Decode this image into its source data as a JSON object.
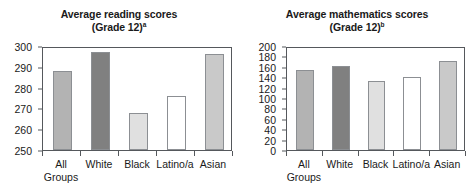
{
  "figure": {
    "panels": [
      {
        "id": "reading",
        "title_line1": "Average reading scores",
        "title_line2": "(Grade 12)",
        "title_superscript": "a"
      },
      {
        "id": "mathematics",
        "title_line1": "Average mathematics scores",
        "title_line2": "(Grade 12)",
        "title_superscript": "b"
      }
    ]
  },
  "chart_data": [
    {
      "type": "bar",
      "title": "Average reading scores (Grade 12)a",
      "xlabel": "",
      "ylabel": "",
      "categories": [
        "All Groups",
        "White",
        "Black",
        "Latino/a",
        "Asian"
      ],
      "category_lines": [
        [
          "All",
          "Groups"
        ],
        [
          "White"
        ],
        [
          "Black"
        ],
        [
          "Latino/a"
        ],
        [
          "Asian"
        ]
      ],
      "values": [
        288,
        297,
        268,
        276,
        296
      ],
      "ylim": [
        250,
        300
      ],
      "yticks": [
        250,
        260,
        270,
        280,
        290,
        300
      ],
      "ytick_labels": [
        "250",
        "260",
        "270",
        "280",
        "290",
        "300"
      ],
      "grid": false,
      "legend": "none",
      "bar_colors": [
        "#b3b3b3",
        "#808080",
        "#e0e0e0",
        "#ffffff",
        "#c9c9c9"
      ],
      "bar_edge_color": "#8c8f93"
    },
    {
      "type": "bar",
      "title": "Average mathematics scores (Grade 12)b",
      "xlabel": "",
      "ylabel": "",
      "categories": [
        "All Groups",
        "White",
        "Black",
        "Latino/a",
        "Asian"
      ],
      "category_lines": [
        [
          "All",
          "Groups"
        ],
        [
          "White"
        ],
        [
          "Black"
        ],
        [
          "Latino/a"
        ],
        [
          "Asian"
        ]
      ],
      "values": [
        153,
        162,
        132,
        141,
        172
      ],
      "ylim": [
        0,
        200
      ],
      "yticks": [
        0,
        20,
        40,
        60,
        80,
        100,
        120,
        140,
        160,
        180,
        200
      ],
      "ytick_labels": [
        "0",
        "20",
        "40",
        "60",
        "80",
        "100",
        "120",
        "140",
        "160",
        "180",
        "200"
      ],
      "grid": false,
      "legend": "none",
      "bar_colors": [
        "#b3b3b3",
        "#808080",
        "#e0e0e0",
        "#ffffff",
        "#c9c9c9"
      ],
      "bar_edge_color": "#8c8f93"
    }
  ]
}
